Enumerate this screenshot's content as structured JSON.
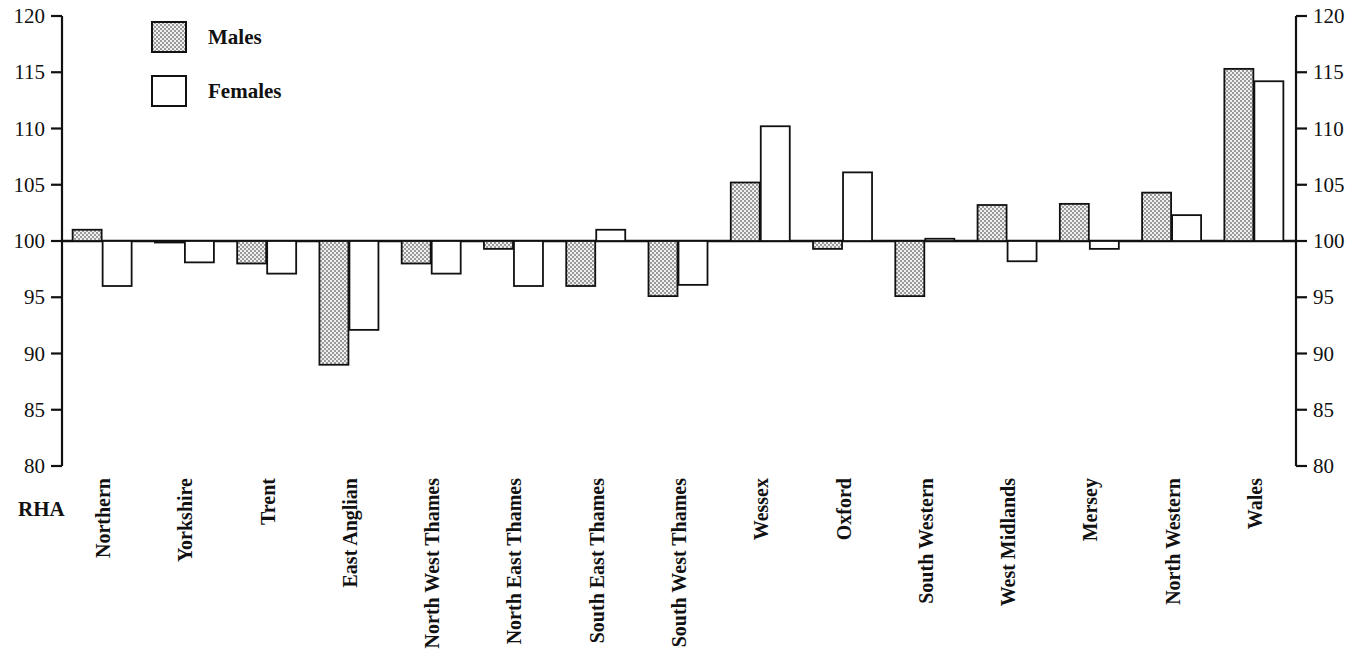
{
  "chart_data": {
    "type": "bar",
    "title": "",
    "subtitle": "",
    "xlabel": "RHA",
    "ylabel": "",
    "ylim": [
      80,
      120
    ],
    "y_ticks": [
      80,
      85,
      90,
      95,
      100,
      105,
      110,
      115,
      120
    ],
    "grid": false,
    "baseline": 100,
    "legend_position": "top-left",
    "dual_y_axis": true,
    "categories": [
      "Northern",
      "Yorkshire",
      "Trent",
      "East Anglian",
      "North West Thames",
      "North East Thames",
      "South East Thames",
      "South West Thames",
      "Wessex",
      "Oxford",
      "South Western",
      "West Midlands",
      "Mersey",
      "North Western",
      "Wales"
    ],
    "series": [
      {
        "name": "Males",
        "fill": "stipple",
        "values": [
          101.0,
          99.9,
          98.0,
          89.0,
          98.0,
          99.3,
          96.0,
          95.1,
          105.2,
          99.3,
          95.1,
          103.2,
          103.3,
          104.3,
          115.3
        ]
      },
      {
        "name": "Females",
        "fill": "white",
        "values": [
          96.0,
          98.1,
          97.1,
          92.1,
          97.1,
          96.0,
          101.0,
          96.1,
          110.2,
          106.1,
          100.2,
          98.2,
          99.3,
          102.3,
          114.2
        ]
      }
    ]
  },
  "legend": {
    "items": [
      {
        "label": "Males",
        "swatch": "stipple"
      },
      {
        "label": "Females",
        "swatch": "white"
      }
    ]
  },
  "axis": {
    "x_title": "RHA",
    "left_ticks": [
      "120",
      "115",
      "110",
      "105",
      "100",
      "95",
      "90",
      "85",
      "80"
    ],
    "right_ticks": [
      "120",
      "115",
      "110",
      "105",
      "100",
      "95",
      "90",
      "85",
      "80"
    ]
  },
  "colors": {
    "ink": "#111111",
    "background": "#ffffff",
    "male_fill": "#d8d8d8",
    "female_fill": "#ffffff"
  }
}
